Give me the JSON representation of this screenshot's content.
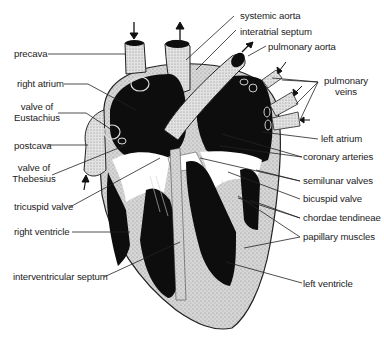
{
  "diagram": {
    "colors": {
      "ink": "#0d0d0d",
      "tissue": "#c8c8c8",
      "vessel": "#dcdcdc",
      "background": "#ffffff",
      "label": "#1c1c1c"
    },
    "labels": {
      "precava": "precava",
      "right_atrium": "right atrium",
      "valve_eustachius_1": "valve of",
      "valve_eustachius_2": "Eustachius",
      "postcava": "postcava",
      "valve_thebesius_1": "valve of",
      "valve_thebesius_2": "Thebesius",
      "tricuspid_valve": "tricuspid valve",
      "right_ventricle": "right ventricle",
      "interventricular_septum": "interventricular septum",
      "systemic_aorta": "systemic aorta",
      "interatrial_septum": "interatrial septum",
      "pulmonary_aorta": "pulmonary aorta",
      "pulmonary_veins_1": "pulmonary",
      "pulmonary_veins_2": "veins",
      "left_atrium": "left atrium",
      "coronary_arteries": "coronary arteries",
      "semilunar_valves": "semilunar valves",
      "bicuspid_valve": "bicuspid valve",
      "chordae_tendineae": "chordae tendineae",
      "papillary_muscles": "papillary muscles",
      "left_ventricle": "left ventricle"
    },
    "flow_arrows": [
      "precava-in-arrow",
      "aorta-out-arrow",
      "pulmonary-aorta-out-arrow",
      "pulmonary-vein-in-arrow",
      "pulmonary-vein-in-arrow",
      "pulmonary-vein-in-arrow",
      "postcava-in-arrow"
    ]
  }
}
